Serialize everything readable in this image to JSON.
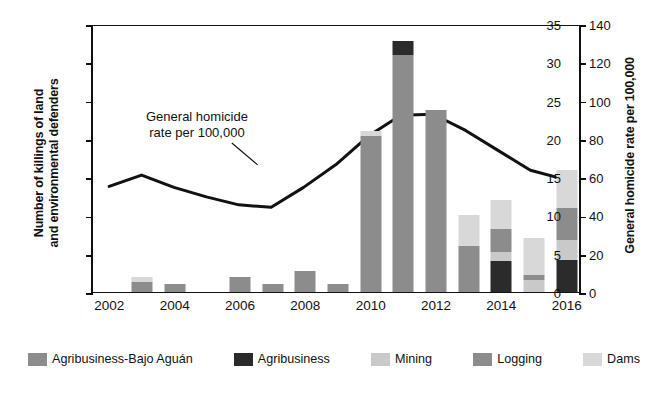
{
  "chart_data": {
    "type": "bar",
    "subtype": "stacked-bar-with-line-overlay",
    "title": "",
    "xlabel": "",
    "ylabel": "Number of killings of land and environmental defenders",
    "y2label": "General homicide rate per 100,000",
    "grid": false,
    "legend_position": "bottom",
    "ylim": [
      0,
      35
    ],
    "yticks": [
      0,
      5,
      10,
      15,
      20,
      25,
      30,
      35
    ],
    "y2lim": [
      0,
      140
    ],
    "y2ticks": [
      0,
      20,
      40,
      60,
      80,
      100,
      120,
      140
    ],
    "x": [
      2002,
      2003,
      2004,
      2005,
      2006,
      2007,
      2008,
      2009,
      2010,
      2011,
      2012,
      2013,
      2014,
      2015,
      2016
    ],
    "xtick_labels": [
      "2002",
      "2004",
      "2006",
      "2008",
      "2010",
      "2012",
      "2014",
      "2016"
    ],
    "categories": [
      "2002",
      "2003",
      "2004",
      "2005",
      "2006",
      "2007",
      "2008",
      "2009",
      "2010",
      "2011",
      "2012",
      "2013",
      "2014",
      "2015",
      "2016"
    ],
    "series": [
      {
        "name": "Agribusiness-Bajo Aguán",
        "color": "#8c8c8c",
        "values": [
          0,
          1.3,
          1,
          0,
          1.9,
          1,
          2.7,
          1,
          20.4,
          31,
          23.8,
          0,
          0,
          0,
          0
        ]
      },
      {
        "name": "Agribusiness",
        "color": "#2b2b2b",
        "values": [
          0,
          0,
          0,
          0,
          0,
          0,
          0,
          0,
          0,
          1.8,
          0,
          0,
          4,
          0,
          4.2
        ]
      },
      {
        "name": "Mining",
        "color": "#c9c9c9",
        "values": [
          0,
          0,
          0,
          0,
          0,
          0,
          0,
          0,
          0,
          0,
          0,
          0,
          1.2,
          1.6,
          2.6
        ]
      },
      {
        "name": "Logging",
        "color": "#8c8c8c",
        "values": [
          0,
          0,
          0,
          0,
          0,
          0,
          0,
          0,
          0,
          0,
          0,
          6,
          3,
          0.6,
          4.2
        ]
      },
      {
        "name": "Dams",
        "color": "#d8d8d8",
        "values": [
          0,
          0.7,
          0,
          0,
          0,
          0,
          0,
          0,
          0.6,
          0,
          0,
          4,
          3.8,
          4.8,
          5
        ]
      }
    ],
    "bar_totals": [
      0,
      2,
      1,
      0,
      1.9,
      1,
      2.7,
      1,
      21,
      32.8,
      23.8,
      10,
      12,
      7,
      16
    ],
    "line": {
      "name": "General homicide rate per 100,000",
      "color": "#111111",
      "axis": "y2",
      "annotation": "General homicide rate per 100,000",
      "x": [
        2002,
        2003,
        2004,
        2005,
        2006,
        2007,
        2008,
        2009,
        2010,
        2011,
        2012,
        2013,
        2014,
        2015,
        2016
      ],
      "values": [
        55.5,
        61.5,
        55.0,
        50.0,
        45.8,
        44.5,
        55.0,
        67.0,
        82.0,
        93.0,
        93.5,
        85.0,
        74.5,
        64.0,
        59.5
      ]
    }
  },
  "axes": {
    "left": {
      "title": "Number of killings of land and environmental defenders",
      "title_line1": "Number of killings of land",
      "title_line2": "and environmental defenders",
      "ticks": [
        "35",
        "30",
        "25",
        "20",
        "15",
        "10",
        "5",
        "0"
      ]
    },
    "right": {
      "title": "General homicide rate per 100,000",
      "ticks": [
        "140",
        "120",
        "100",
        "80",
        "60",
        "40",
        "20",
        "0"
      ]
    },
    "x": {
      "ticks": [
        "2002",
        "2004",
        "2006",
        "2008",
        "2010",
        "2012",
        "2014",
        "2016"
      ]
    }
  },
  "annotation": {
    "line1": "General homicide",
    "line2": "rate per 100,000"
  },
  "legend": {
    "items": [
      {
        "label": "Agribusiness-Bajo Aguán",
        "color": "#8c8c8c"
      },
      {
        "label": "Agribusiness",
        "color": "#2b2b2b"
      },
      {
        "label": "Mining",
        "color": "#c9c9c9"
      },
      {
        "label": "Logging",
        "color": "#8c8c8c"
      },
      {
        "label": "Dams",
        "color": "#d8d8d8"
      }
    ]
  }
}
